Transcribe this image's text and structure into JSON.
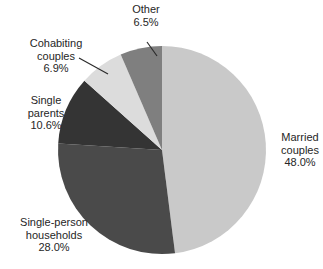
{
  "chart_data": {
    "type": "pie",
    "title": "",
    "legend": "none",
    "direction": "clockwise",
    "start_angle_deg": -90,
    "categories": [
      "Married couples",
      "Single-person households",
      "Single parents",
      "Cohabiting couples",
      "Other"
    ],
    "values": [
      48.0,
      28.0,
      10.6,
      6.9,
      6.5
    ],
    "slices": [
      {
        "name": "Married couples",
        "value": 48.0,
        "pct_label": "48.0%",
        "color": "#c9c9c9",
        "label_lines": [
          "Married",
          "couples",
          "48.0%"
        ]
      },
      {
        "name": "Single-person households",
        "value": 28.0,
        "pct_label": "28.0%",
        "color": "#4a4a4a",
        "label_lines": [
          "Single-person",
          "households",
          "28.0%"
        ]
      },
      {
        "name": "Single parents",
        "value": 10.6,
        "pct_label": "10.6%",
        "color": "#343434",
        "label_lines": [
          "Single",
          "parents",
          "10.6%"
        ]
      },
      {
        "name": "Cohabiting couples",
        "value": 6.9,
        "pct_label": "6.9%",
        "color": "#dcdcdc",
        "label_lines": [
          "Cohabiting",
          "couples",
          "6.9%"
        ]
      },
      {
        "name": "Other",
        "value": 6.5,
        "pct_label": "6.5%",
        "color": "#7f7f7f",
        "label_lines": [
          "Other",
          "6.5%"
        ]
      }
    ]
  }
}
